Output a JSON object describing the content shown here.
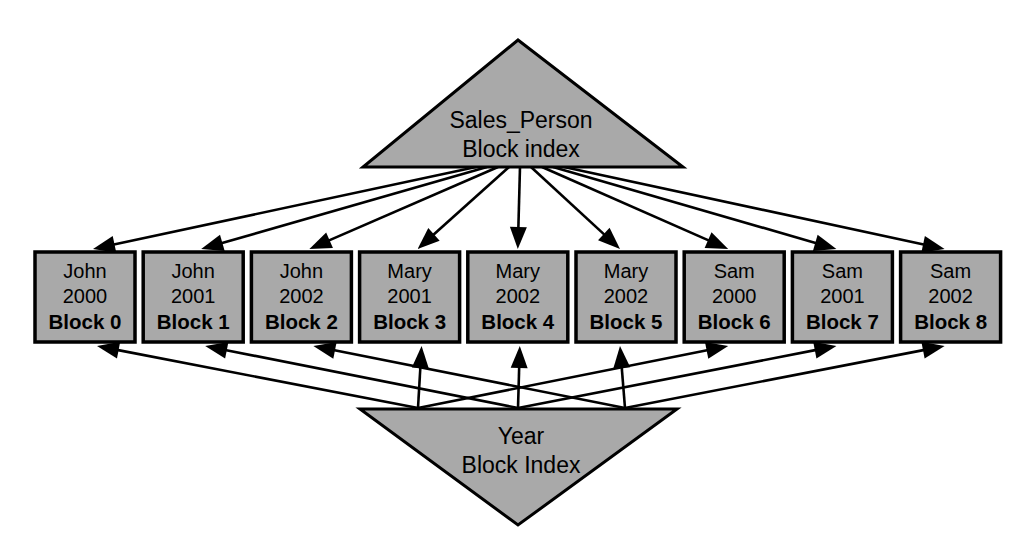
{
  "diagram": {
    "type": "bitmap-index-diagram",
    "background_color": "#ffffff",
    "shape_fill_color": "#a9a9a9",
    "stroke_color": "#000000",
    "top_index": {
      "name": "top-triangle",
      "line1": "Sales_Person",
      "line2": "Block index"
    },
    "bottom_index": {
      "name": "bottom-triangle",
      "line1": "Year",
      "line2": "Block Index"
    },
    "blocks": [
      {
        "person": "John",
        "year": "2000",
        "block": "Block 0"
      },
      {
        "person": "John",
        "year": "2001",
        "block": "Block 1"
      },
      {
        "person": "John",
        "year": "2002",
        "block": "Block 2"
      },
      {
        "person": "Mary",
        "year": "2001",
        "block": "Block 3"
      },
      {
        "person": "Mary",
        "year": "2002",
        "block": "Block 4"
      },
      {
        "person": "Mary",
        "year": "2002",
        "block": "Block 5"
      },
      {
        "person": "Sam",
        "year": "2000",
        "block": "Block 6"
      },
      {
        "person": "Sam",
        "year": "2001",
        "block": "Block 7"
      },
      {
        "person": "Sam",
        "year": "2002",
        "block": "Block 8"
      }
    ]
  }
}
